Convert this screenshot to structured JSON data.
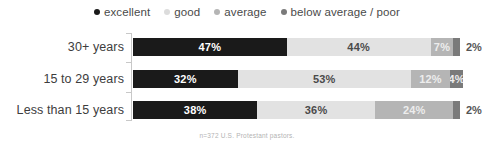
{
  "chart_data": {
    "type": "bar",
    "subtype": "stacked-horizontal-100",
    "title": "",
    "xlabel": "",
    "ylabel": "",
    "grid": false,
    "legend_position": "top-center",
    "xlim": [
      0,
      100
    ],
    "categories": [
      "30+ years",
      "15 to 29 years",
      "Less than 15 years"
    ],
    "series": [
      {
        "name": "excellent",
        "color": "#1a1a1a",
        "values": [
          47,
          32,
          38
        ]
      },
      {
        "name": "good",
        "color": "#e2e2e2",
        "values": [
          44,
          53,
          36
        ]
      },
      {
        "name": "average",
        "color": "#b5b5b5",
        "values": [
          7,
          12,
          24
        ]
      },
      {
        "name": "below average / poor",
        "color": "#7a7a7a",
        "values": [
          2,
          4,
          2
        ]
      }
    ],
    "annotation": "n=372 U.S. Protestant pastors."
  },
  "legend": {
    "items": [
      {
        "label": "excellent",
        "color": "#1a1a1a"
      },
      {
        "label": "good",
        "color": "#dcdcdc"
      },
      {
        "label": "average",
        "color": "#b5b5b5"
      },
      {
        "label": "below average / poor",
        "color": "#7a7a7a"
      }
    ]
  },
  "rows": [
    {
      "category": "30+ years",
      "segments": [
        {
          "label": "47%",
          "value": 47,
          "color": "#1a1a1a",
          "text_color": "#ffffff",
          "inside": true
        },
        {
          "label": "44%",
          "value": 44,
          "color": "#e2e2e2",
          "text_color": "#4a4a4a",
          "inside": true
        },
        {
          "label": "7%",
          "value": 7,
          "color": "#b5b5b5",
          "text_color": "#ededed",
          "inside": true
        },
        {
          "label": "2%",
          "value": 2,
          "color": "#7a7a7a",
          "text_color": "#555555",
          "inside": false
        }
      ]
    },
    {
      "category": "15 to 29 years",
      "segments": [
        {
          "label": "32%",
          "value": 32,
          "color": "#1a1a1a",
          "text_color": "#ffffff",
          "inside": true
        },
        {
          "label": "53%",
          "value": 53,
          "color": "#e2e2e2",
          "text_color": "#4a4a4a",
          "inside": true
        },
        {
          "label": "12%",
          "value": 12,
          "color": "#b5b5b5",
          "text_color": "#ededed",
          "inside": true
        },
        {
          "label": "4%",
          "value": 4,
          "color": "#7a7a7a",
          "text_color": "#ededed",
          "inside": true
        }
      ]
    },
    {
      "category": "Less than 15 years",
      "segments": [
        {
          "label": "38%",
          "value": 38,
          "color": "#1a1a1a",
          "text_color": "#ffffff",
          "inside": true
        },
        {
          "label": "36%",
          "value": 36,
          "color": "#e2e2e2",
          "text_color": "#4a4a4a",
          "inside": true
        },
        {
          "label": "24%",
          "value": 24,
          "color": "#b5b5b5",
          "text_color": "#ededed",
          "inside": true
        },
        {
          "label": "2%",
          "value": 2,
          "color": "#7a7a7a",
          "text_color": "#555555",
          "inside": false
        }
      ]
    }
  ],
  "footnote": "n=372 U.S. Protestant pastors."
}
